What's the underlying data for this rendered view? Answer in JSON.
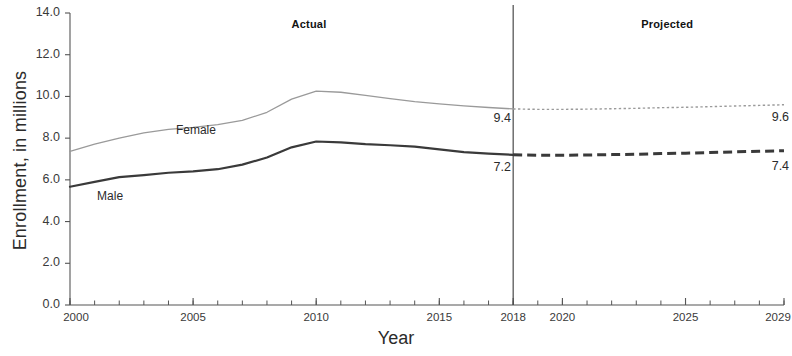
{
  "chart_data": {
    "type": "line",
    "title": "",
    "xlabel": "Year",
    "ylabel": "Enrollment, in millions",
    "xlim": [
      2000,
      2029
    ],
    "ylim": [
      0.0,
      14.0
    ],
    "grid": false,
    "legend_position": "inline-annotations",
    "y_ticks": [
      "0.0",
      "2.0",
      "4.0",
      "6.0",
      "8.0",
      "10.0",
      "12.0",
      "14.0"
    ],
    "y_tick_values": [
      0.0,
      2.0,
      4.0,
      6.0,
      8.0,
      10.0,
      12.0,
      14.0
    ],
    "x_ticks": [
      "2000",
      "2005",
      "2010",
      "2015",
      "2018",
      "2020",
      "2025",
      "2029"
    ],
    "x_tick_values": [
      2000,
      2005,
      2010,
      2015,
      2018,
      2020,
      2025,
      2029
    ],
    "x_minor_tick_step": 1,
    "divider_year": 2018,
    "annotations": [
      {
        "text": "Actual",
        "x": 2009,
        "y": 13.4,
        "bold": true
      },
      {
        "text": "Projected",
        "x": 2023.2,
        "y": 13.4,
        "bold": true
      },
      {
        "text": "Female",
        "x": 2004.3,
        "y": 8.35
      },
      {
        "text": "Male",
        "x": 2001.1,
        "y": 5.2
      },
      {
        "text": "9.4",
        "x": 2017.2,
        "y": 8.9
      },
      {
        "text": "7.2",
        "x": 2017.2,
        "y": 6.55
      },
      {
        "text": "9.6",
        "x": 2028.5,
        "y": 8.95
      },
      {
        "text": "7.4",
        "x": 2028.5,
        "y": 6.6
      }
    ],
    "x": [
      2000,
      2001,
      2002,
      2003,
      2004,
      2005,
      2006,
      2007,
      2008,
      2009,
      2010,
      2011,
      2012,
      2013,
      2014,
      2015,
      2016,
      2017,
      2018,
      2019,
      2020,
      2021,
      2022,
      2023,
      2024,
      2025,
      2026,
      2027,
      2028,
      2029
    ],
    "series": [
      {
        "name": "Female",
        "color": "#9a9a9a",
        "actual_style": "solid-thin",
        "projected_style": "dotted",
        "values": [
          7.37,
          7.71,
          8.0,
          8.25,
          8.42,
          8.52,
          8.65,
          8.85,
          9.24,
          9.87,
          10.25,
          10.2,
          10.05,
          9.89,
          9.75,
          9.64,
          9.55,
          9.47,
          9.4,
          9.38,
          9.38,
          9.39,
          9.41,
          9.43,
          9.46,
          9.48,
          9.51,
          9.54,
          9.57,
          9.6
        ]
      },
      {
        "name": "Male",
        "color": "#3a3a3a",
        "actual_style": "solid-thick",
        "projected_style": "dashed",
        "values": [
          5.67,
          5.9,
          6.13,
          6.23,
          6.34,
          6.41,
          6.51,
          6.73,
          7.07,
          7.56,
          7.84,
          7.8,
          7.71,
          7.66,
          7.59,
          7.46,
          7.33,
          7.26,
          7.2,
          7.18,
          7.18,
          7.19,
          7.21,
          7.23,
          7.26,
          7.28,
          7.31,
          7.34,
          7.37,
          7.4
        ]
      }
    ],
    "labels": {
      "actual_period": "Actual",
      "projected_period": "Projected",
      "female_series": "Female",
      "male_series": "Male",
      "female_divider_value": "9.4",
      "male_divider_value": "7.2",
      "female_end_value": "9.6",
      "male_end_value": "7.4"
    },
    "colors": {
      "axis": "#555555",
      "divider": "#4a4a4a",
      "female": "#9a9a9a",
      "male": "#3a3a3a",
      "text": "#2b2b2b"
    }
  }
}
